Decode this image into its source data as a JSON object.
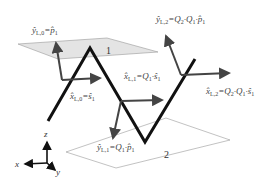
{
  "diagram": {
    "planes": [
      {
        "id": "plane-1",
        "label": "1",
        "style": "shaded"
      },
      {
        "id": "plane-2",
        "label": "2",
        "style": "outline"
      }
    ],
    "labels": {
      "y_l0": {
        "sym": "ŷ",
        "sub": "L,0",
        "rhs": "=p̂",
        "rhs_sub": "1"
      },
      "x_l0": {
        "sym": "x̂",
        "sub": "L,0",
        "rhs": "=ŝ",
        "rhs_sub": "1"
      },
      "y_l2": {
        "sym": "ŷ",
        "sub": "L,2",
        "rhs": "=Q",
        "rhs_sub": "2",
        "rhs2": "·Q",
        "rhs2_sub": "1",
        "rhs3": "·p̂",
        "rhs3_sub": "1"
      },
      "x_l1": {
        "sym": "x̂",
        "sub": "L,1",
        "rhs": "=Q",
        "rhs_sub": "1",
        "rhs2": "·ŝ",
        "rhs2_sub": "1"
      },
      "x_l2": {
        "sym": "x̂",
        "sub": "L,2",
        "rhs": "=Q",
        "rhs_sub": "2",
        "rhs2": "·Q",
        "rhs2_sub": "1",
        "rhs3": "·ŝ",
        "rhs3_sub": "1"
      },
      "y_l1": {
        "sym": "ŷ",
        "sub": "L,1",
        "rhs": "=Q",
        "rhs_sub": "1",
        "rhs2": "·p̂",
        "rhs2_sub": "1"
      }
    },
    "axes": {
      "x": "x",
      "y": "y",
      "z": "z"
    },
    "colors": {
      "path": "#111111",
      "arrow": "#444444",
      "plane_fill": "#e4e4e4",
      "plane_edge": "#888888"
    }
  }
}
